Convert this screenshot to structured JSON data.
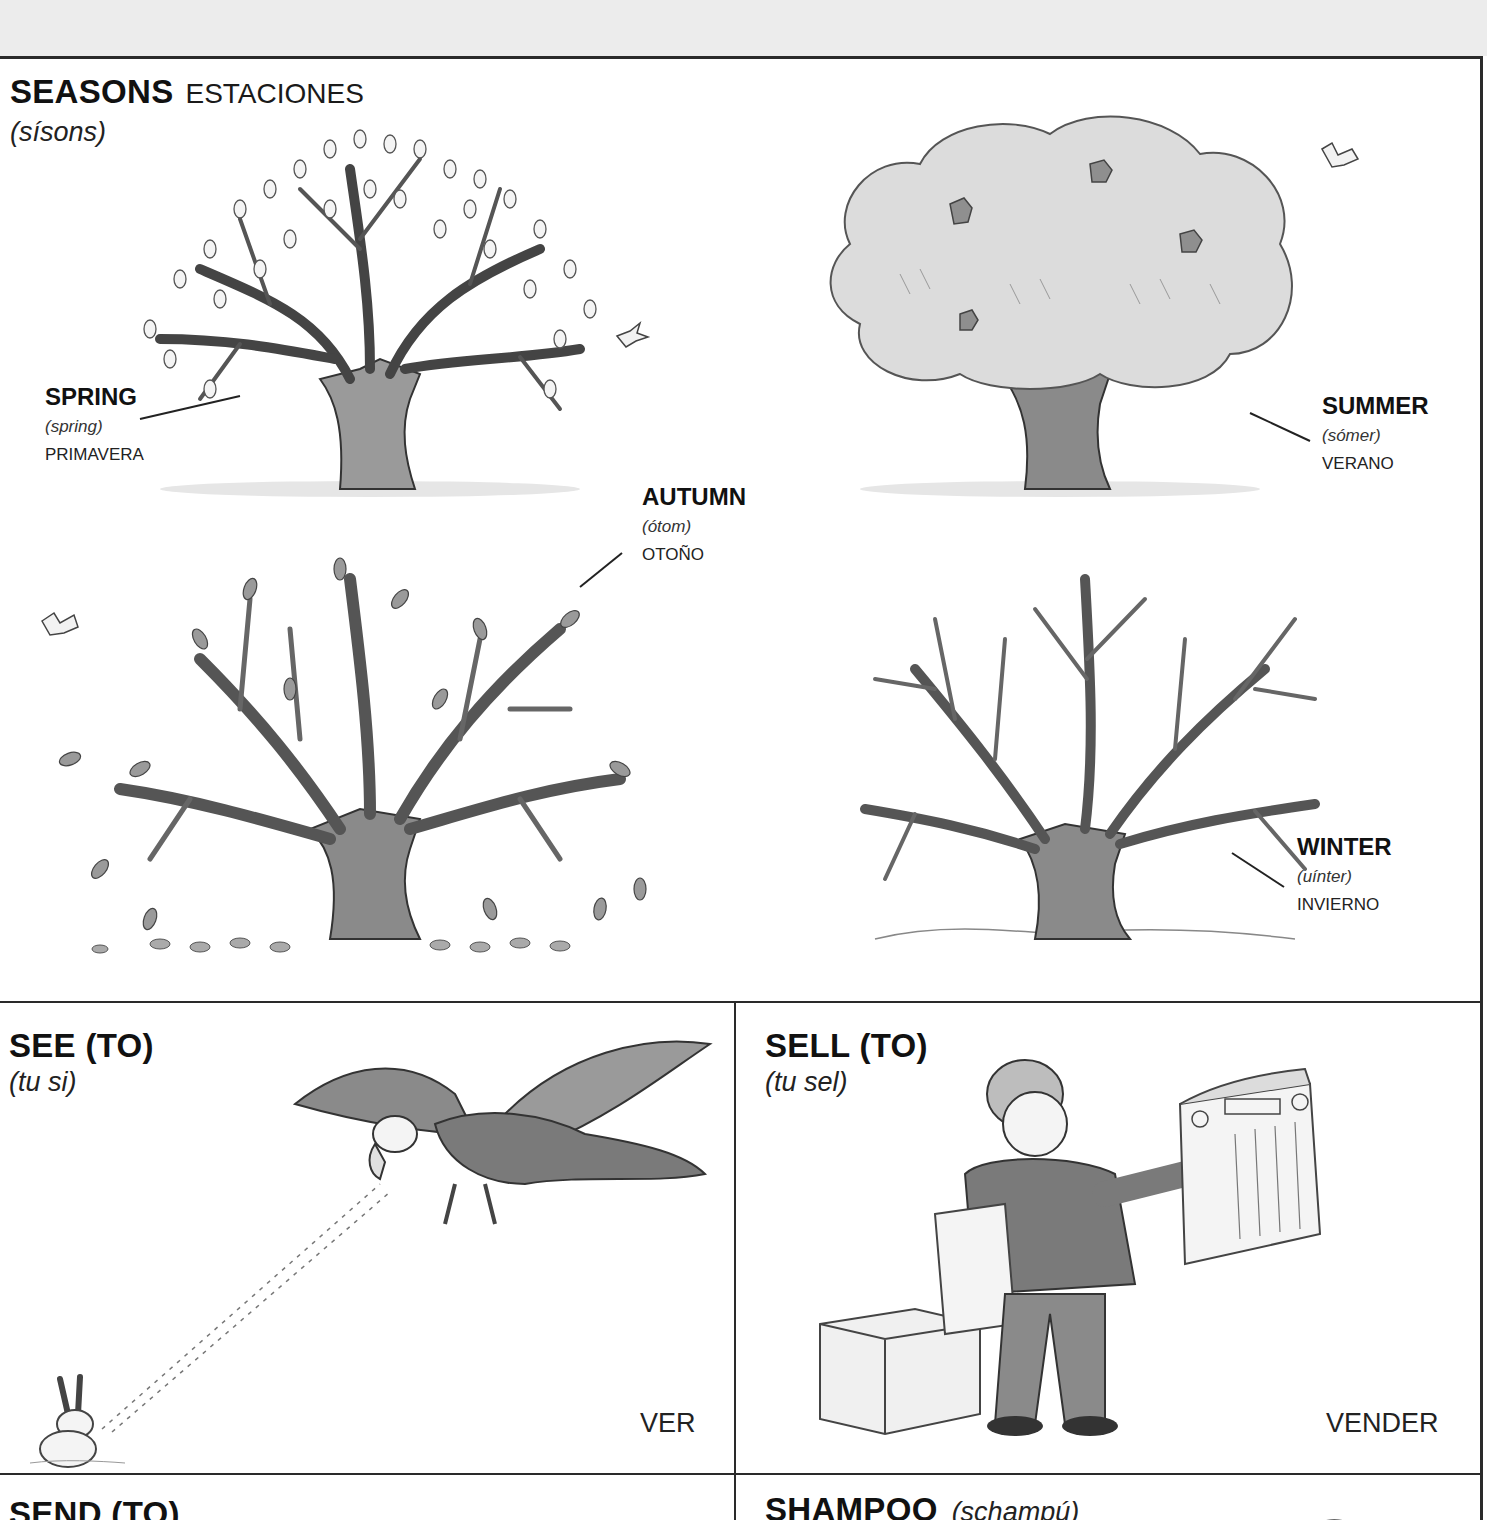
{
  "seasons": {
    "title": "SEASONS",
    "title_translation": "ESTACIONES",
    "pronunciation": "(sísons)",
    "items": [
      {
        "id": "spring",
        "term": "SPRING",
        "pronunciation": "(spring)",
        "translation": "PRIMAVERA"
      },
      {
        "id": "summer",
        "term": "SUMMER",
        "pronunciation": "(sómer)",
        "translation": "VERANO"
      },
      {
        "id": "autumn",
        "term": "AUTUMN",
        "pronunciation": "(ótom)",
        "translation": "OTOÑO"
      },
      {
        "id": "winter",
        "term": "WINTER",
        "pronunciation": "(uínter)",
        "translation": "INVIERNO"
      }
    ]
  },
  "entries": [
    {
      "id": "see",
      "term": "SEE (TO)",
      "pronunciation": "(tu si)",
      "translation": "VER"
    },
    {
      "id": "sell",
      "term": "SELL (TO)",
      "pronunciation": "(tu sel)",
      "translation": "VENDER"
    },
    {
      "id": "send",
      "term": "SEND (TO)"
    },
    {
      "id": "shampoo",
      "term": "SHAMPOO",
      "pronunciation": "(schampú)"
    }
  ],
  "colors": {
    "border": "#2a2a2a",
    "top_strip": "#ececec",
    "ink": "#1a1a1a"
  }
}
